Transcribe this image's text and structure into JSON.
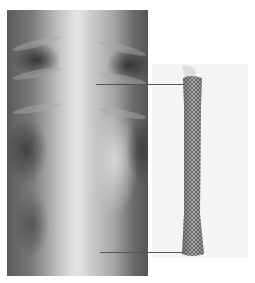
{
  "figure": {
    "panels": [
      {
        "name": "chest-xray",
        "description": "Frontal chest radiograph"
      },
      {
        "name": "stent-photo",
        "description": "Self-expanding metal mesh stent"
      }
    ],
    "pointers": [
      {
        "name": "upper-pointer",
        "label": ""
      },
      {
        "name": "lower-pointer",
        "label": ""
      }
    ]
  }
}
